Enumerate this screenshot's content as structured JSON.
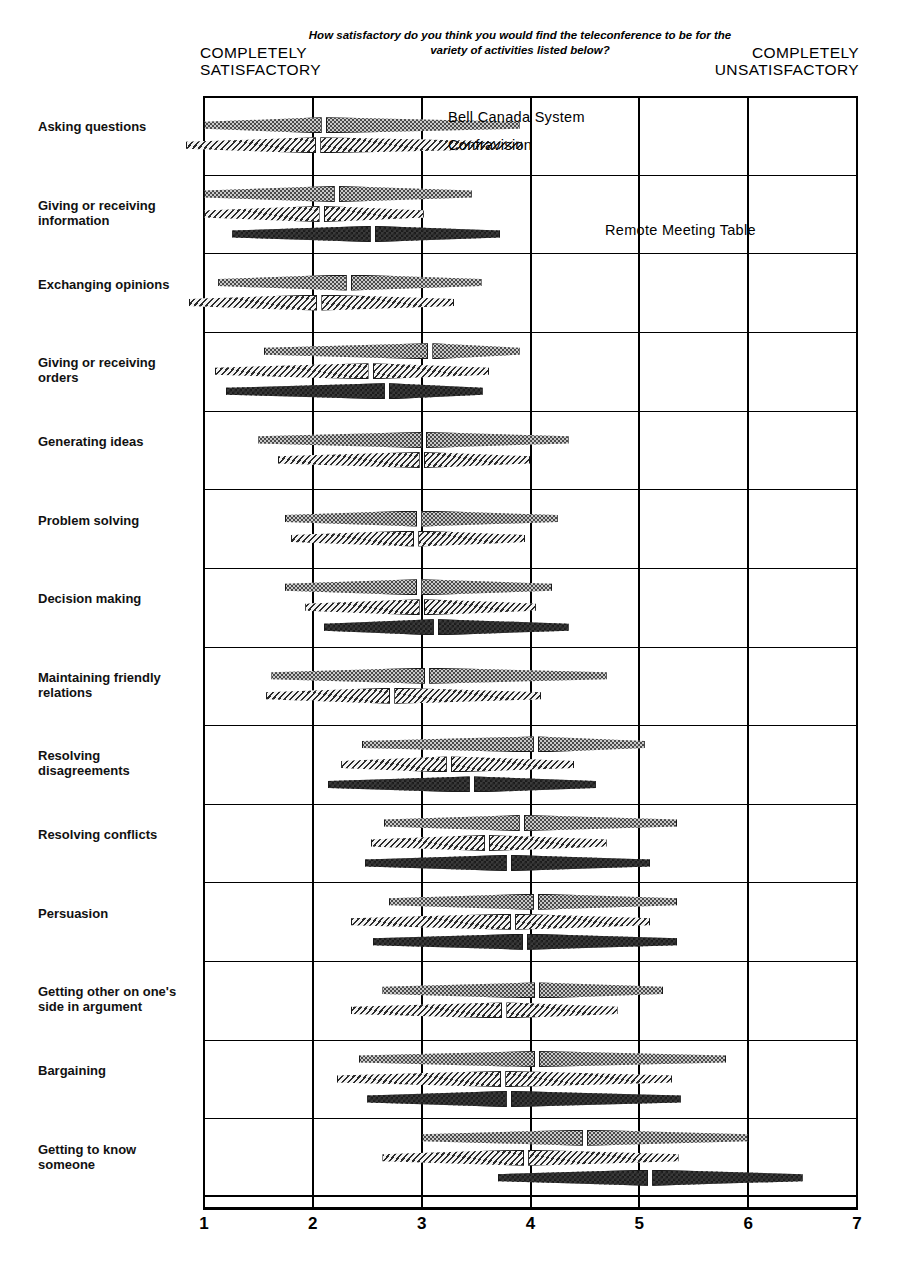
{
  "header": {
    "left_scale_label": "COMPLETELY\nSATISFACTORY",
    "right_scale_label": "COMPLETELY\nUNSATISFACTORY",
    "question": "How satisfactory do you think you would find the teleconference to be for the variety of activities listed below?"
  },
  "legend": {
    "bell": "Bell Canada System",
    "confravision": "Confravision",
    "rmt": "Remote  Meeting  Table"
  },
  "axis": {
    "ticks": [
      "1",
      "2",
      "3",
      "4",
      "5",
      "6",
      "7"
    ]
  },
  "chart_data": {
    "type": "bar",
    "title": "How satisfactory do you think you would find the teleconference to be for the variety of activities listed below?",
    "xlabel": "",
    "ylabel": "",
    "xlim": [
      1,
      7
    ],
    "x_ticks": [
      1,
      2,
      3,
      4,
      5,
      6,
      7
    ],
    "grid": true,
    "legend_position": "inline-annotations",
    "scale_anchor_low": "COMPLETELY SATISFACTORY",
    "scale_anchor_high": "COMPLETELY UNSATISFACTORY",
    "series": [
      {
        "name": "Bell Canada System",
        "key": "bell",
        "pattern": "light-dotted"
      },
      {
        "name": "Confravision",
        "key": "confravision",
        "pattern": "diagonal-hatch"
      },
      {
        "name": "Remote Meeting Table",
        "key": "rmt",
        "pattern": "dark-checker"
      }
    ],
    "categories": [
      "Asking questions",
      "Giving or receiving information",
      "Exchanging opinions",
      "Giving or receiving orders",
      "Generating ideas",
      "Problem solving",
      "Decision making",
      "Maintaining friendly relations",
      "Resolving disagreements",
      "Resolving conflicts",
      "Persuasion",
      "Getting other on one's side in argument",
      "Bargaining",
      "Getting to know someone"
    ],
    "rows": [
      {
        "label": "Asking questions",
        "label_display": "Asking questions",
        "bars": [
          {
            "key": "bell",
            "low": 1.0,
            "median": 2.1,
            "high": 3.9
          },
          {
            "key": "confravision",
            "low": 0.83,
            "median": 2.05,
            "high": 3.92
          }
        ]
      },
      {
        "label": "Giving or receiving information",
        "label_display": "Giving or receiving\ninformation",
        "bars": [
          {
            "key": "bell",
            "low": 1.0,
            "median": 2.22,
            "high": 3.46
          },
          {
            "key": "confravision",
            "low": 1.0,
            "median": 2.08,
            "high": 3.02
          },
          {
            "key": "rmt",
            "low": 1.26,
            "median": 2.55,
            "high": 3.72
          }
        ]
      },
      {
        "label": "Exchanging opinions",
        "label_display": "Exchanging opinions",
        "bars": [
          {
            "key": "bell",
            "low": 1.13,
            "median": 2.33,
            "high": 3.55
          },
          {
            "key": "confravision",
            "low": 0.86,
            "median": 2.06,
            "high": 3.3
          }
        ]
      },
      {
        "label": "Giving or receiving orders",
        "label_display": "Giving or receiving\norders",
        "bars": [
          {
            "key": "bell",
            "low": 1.55,
            "median": 3.08,
            "high": 3.9
          },
          {
            "key": "confravision",
            "low": 1.1,
            "median": 2.53,
            "high": 3.62
          },
          {
            "key": "rmt",
            "low": 1.2,
            "median": 2.68,
            "high": 3.56
          }
        ]
      },
      {
        "label": "Generating ideas",
        "label_display": "Generating ideas",
        "bars": [
          {
            "key": "bell",
            "low": 1.5,
            "median": 3.02,
            "high": 4.35
          },
          {
            "key": "confravision",
            "low": 1.68,
            "median": 3.0,
            "high": 4.0
          }
        ]
      },
      {
        "label": "Problem solving",
        "label_display": "Problem solving",
        "bars": [
          {
            "key": "bell",
            "low": 1.74,
            "median": 2.98,
            "high": 4.25
          },
          {
            "key": "confravision",
            "low": 1.8,
            "median": 2.95,
            "high": 3.95
          }
        ]
      },
      {
        "label": "Decision making",
        "label_display": "Decision making",
        "bars": [
          {
            "key": "bell",
            "low": 1.74,
            "median": 2.98,
            "high": 4.2
          },
          {
            "key": "confravision",
            "low": 1.93,
            "median": 3.0,
            "high": 4.05
          },
          {
            "key": "rmt",
            "low": 2.1,
            "median": 3.13,
            "high": 4.35
          }
        ]
      },
      {
        "label": "Maintaining friendly relations",
        "label_display": "Maintaining friendly\nrelations",
        "bars": [
          {
            "key": "bell",
            "low": 1.62,
            "median": 3.05,
            "high": 4.7
          },
          {
            "key": "confravision",
            "low": 1.57,
            "median": 2.73,
            "high": 4.1
          }
        ]
      },
      {
        "label": "Resolving disagreements",
        "label_display": "Resolving\ndisagreements",
        "bars": [
          {
            "key": "bell",
            "low": 2.45,
            "median": 4.05,
            "high": 5.05
          },
          {
            "key": "confravision",
            "low": 2.26,
            "median": 3.25,
            "high": 4.4
          },
          {
            "key": "rmt",
            "low": 2.14,
            "median": 3.46,
            "high": 4.6
          }
        ]
      },
      {
        "label": "Resolving conflicts",
        "label_display": "Resolving conflicts",
        "bars": [
          {
            "key": "bell",
            "low": 2.65,
            "median": 3.92,
            "high": 5.35
          },
          {
            "key": "confravision",
            "low": 2.53,
            "median": 3.6,
            "high": 4.7
          },
          {
            "key": "rmt",
            "low": 2.48,
            "median": 3.8,
            "high": 5.1
          }
        ]
      },
      {
        "label": "Persuasion",
        "label_display": "Persuasion",
        "bars": [
          {
            "key": "bell",
            "low": 2.7,
            "median": 4.05,
            "high": 5.35
          },
          {
            "key": "confravision",
            "low": 2.35,
            "median": 3.84,
            "high": 5.1
          },
          {
            "key": "rmt",
            "low": 2.55,
            "median": 3.95,
            "high": 5.35
          }
        ]
      },
      {
        "label": "Getting other on one's side in argument",
        "label_display": "Getting other on one's\nside in argument",
        "bars": [
          {
            "key": "bell",
            "low": 2.64,
            "median": 4.06,
            "high": 5.22
          },
          {
            "key": "confravision",
            "low": 2.35,
            "median": 3.76,
            "high": 4.8
          }
        ]
      },
      {
        "label": "Bargaining",
        "label_display": "Bargaining",
        "bars": [
          {
            "key": "bell",
            "low": 2.42,
            "median": 4.06,
            "high": 5.8
          },
          {
            "key": "confravision",
            "low": 2.22,
            "median": 3.75,
            "high": 5.3
          },
          {
            "key": "rmt",
            "low": 2.5,
            "median": 3.8,
            "high": 5.38
          }
        ]
      },
      {
        "label": "Getting to know someone",
        "label_display": "Getting to know\nsomeone",
        "bars": [
          {
            "key": "bell",
            "low": 3.0,
            "median": 4.5,
            "high": 6.0
          },
          {
            "key": "confravision",
            "low": 2.64,
            "median": 3.96,
            "high": 5.36
          },
          {
            "key": "rmt",
            "low": 3.7,
            "median": 5.1,
            "high": 6.5
          }
        ]
      }
    ]
  }
}
